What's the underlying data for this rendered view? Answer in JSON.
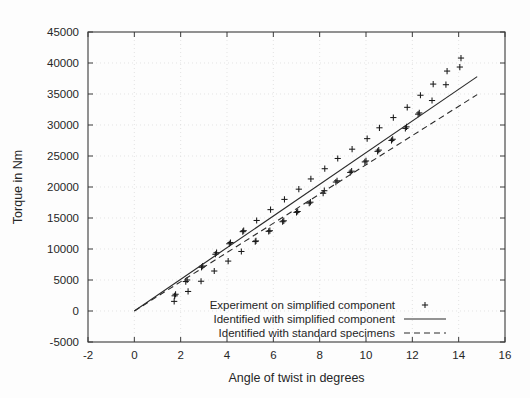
{
  "chart_data": {
    "type": "scatter",
    "title": "",
    "xlabel": "Angle of twist in degrees",
    "ylabel": "Torque in Nm",
    "xlim": [
      -2,
      16
    ],
    "ylim": [
      -5000,
      45000
    ],
    "xticks": [
      -2,
      0,
      2,
      4,
      6,
      8,
      10,
      12,
      14,
      16
    ],
    "yticks": [
      -5000,
      0,
      5000,
      10000,
      15000,
      20000,
      25000,
      30000,
      35000,
      40000,
      45000
    ],
    "xtick_labels": [
      "-2",
      "0",
      "2",
      "4",
      "6",
      "8",
      "10",
      "12",
      "14",
      "16"
    ],
    "ytick_labels": [
      "-5000",
      "0",
      "5000",
      "10000",
      "15000",
      "20000",
      "25000",
      "30000",
      "35000",
      "40000",
      "45000"
    ],
    "grid": true,
    "legend_position": "lower right",
    "series": [
      {
        "name": "Experiment on simplified component",
        "type": "scatter",
        "marker": "+",
        "points": [
          [
            1.72,
            1550
          ],
          [
            1.74,
            2450
          ],
          [
            1.78,
            2700
          ],
          [
            2.22,
            4750
          ],
          [
            2.28,
            5000
          ],
          [
            2.32,
            3150
          ],
          [
            2.88,
            4800
          ],
          [
            2.9,
            7050
          ],
          [
            2.95,
            7250
          ],
          [
            3.45,
            6450
          ],
          [
            3.5,
            9150
          ],
          [
            3.55,
            9400
          ],
          [
            4.05,
            8050
          ],
          [
            4.1,
            10850
          ],
          [
            4.15,
            11050
          ],
          [
            4.62,
            9600
          ],
          [
            4.68,
            12800
          ],
          [
            4.72,
            12950
          ],
          [
            5.22,
            11200
          ],
          [
            5.25,
            11300
          ],
          [
            5.28,
            14600
          ],
          [
            5.8,
            12850
          ],
          [
            5.85,
            12950
          ],
          [
            5.88,
            16350
          ],
          [
            6.4,
            14400
          ],
          [
            6.45,
            14550
          ],
          [
            6.48,
            18000
          ],
          [
            7.0,
            15900
          ],
          [
            7.05,
            16050
          ],
          [
            7.1,
            19650
          ],
          [
            7.55,
            17400
          ],
          [
            7.6,
            17550
          ],
          [
            7.62,
            21300
          ],
          [
            8.15,
            19000
          ],
          [
            8.2,
            19400
          ],
          [
            8.22,
            22950
          ],
          [
            8.7,
            20800
          ],
          [
            8.75,
            21000
          ],
          [
            8.78,
            24600
          ],
          [
            9.32,
            22350
          ],
          [
            9.38,
            22550
          ],
          [
            9.4,
            26100
          ],
          [
            9.95,
            24050
          ],
          [
            10.0,
            24200
          ],
          [
            10.05,
            27800
          ],
          [
            10.5,
            25750
          ],
          [
            10.55,
            25950
          ],
          [
            10.58,
            29550
          ],
          [
            11.1,
            27500
          ],
          [
            11.15,
            27700
          ],
          [
            11.18,
            31200
          ],
          [
            11.7,
            29450
          ],
          [
            11.75,
            29700
          ],
          [
            11.78,
            32850
          ],
          [
            12.25,
            31750
          ],
          [
            12.3,
            31950
          ],
          [
            12.35,
            34800
          ],
          [
            12.85,
            33950
          ],
          [
            12.9,
            36600
          ],
          [
            13.45,
            36500
          ],
          [
            13.5,
            38700
          ],
          [
            14.05,
            39350
          ],
          [
            14.1,
            40800
          ]
        ]
      },
      {
        "name": "Identified with simplified component",
        "type": "line",
        "style": "solid",
        "x": [
          0,
          14.8
        ],
        "y": [
          0,
          37800
        ]
      },
      {
        "name": "Identified with standard specimens",
        "type": "line",
        "style": "dashed",
        "x": [
          0,
          14.8
        ],
        "y": [
          0,
          34900
        ]
      }
    ]
  },
  "legend": {
    "entries": [
      {
        "label": "Experiment on simplified component",
        "symbol": "plus-marker"
      },
      {
        "label": "Identified with simplified component",
        "symbol": "solid-line"
      },
      {
        "label": "Identified with standard specimens",
        "symbol": "dashed-line"
      }
    ]
  }
}
